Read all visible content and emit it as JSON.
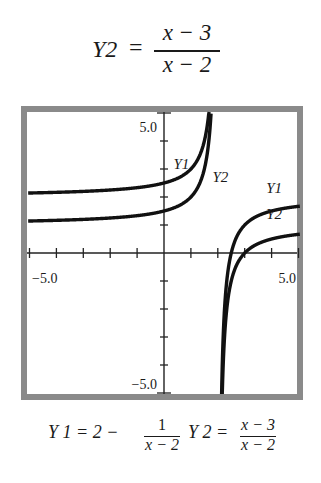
{
  "title": {
    "lhs": "Y2",
    "equals": "=",
    "numerator": "x − 3",
    "denominator": "x − 2"
  },
  "caption": {
    "y1_lhs": "Y 1 = 2 −",
    "y1_num": "1",
    "y1_den": "x − 2",
    "y2_lhs": "Y 2 =",
    "y2_num": "x − 3",
    "y2_den": "x − 2"
  },
  "chart_data": {
    "type": "line",
    "xlabel": "",
    "ylabel": "",
    "xlim": [
      -5,
      5
    ],
    "ylim": [
      -5,
      5
    ],
    "grid": false,
    "x_ticks": [
      -5,
      -4,
      -3,
      -2,
      -1,
      0,
      1,
      2,
      3,
      4,
      5
    ],
    "y_ticks": [
      -5,
      -4,
      -3,
      -2,
      -1,
      0,
      1,
      2,
      3,
      4,
      5
    ],
    "tick_labels": {
      "x_min": "−5.0",
      "x_max": "5.0",
      "y_max": "5.0",
      "y_min": "−5.0"
    },
    "vertical_asymptote": 2,
    "series": [
      {
        "name": "Y1",
        "formula": "2 − 1/(x − 2)",
        "horizontal_asymptote": 2,
        "label_positions": [
          {
            "x": 0.35,
            "y": 3.0
          },
          {
            "x": 3.8,
            "y": 2.15
          }
        ]
      },
      {
        "name": "Y2",
        "formula": "(x − 3)/(x − 2)",
        "horizontal_asymptote": 1,
        "label_positions": [
          {
            "x": 1.8,
            "y": 2.55
          },
          {
            "x": 3.8,
            "y": 1.2
          }
        ]
      }
    ],
    "sample_points": {
      "Y1": [
        [
          -5,
          2.14
        ],
        [
          -2,
          2.25
        ],
        [
          0,
          2.5
        ],
        [
          1,
          3
        ],
        [
          1.5,
          4
        ],
        [
          1.8,
          7
        ],
        [
          2.2,
          -3
        ],
        [
          2.5,
          0
        ],
        [
          3,
          1
        ],
        [
          4,
          1.5
        ],
        [
          5,
          1.67
        ]
      ],
      "Y2": [
        [
          -5,
          1.14
        ],
        [
          -2,
          1.25
        ],
        [
          0,
          1.5
        ],
        [
          1,
          2
        ],
        [
          1.5,
          3
        ],
        [
          1.8,
          6
        ],
        [
          2.2,
          -4
        ],
        [
          2.5,
          -1
        ],
        [
          3,
          0
        ],
        [
          4,
          0.5
        ],
        [
          5,
          0.67
        ]
      ]
    }
  }
}
